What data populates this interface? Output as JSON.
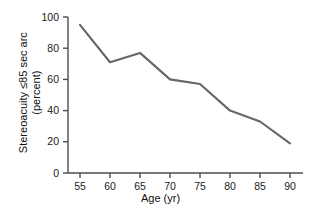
{
  "chart_data": {
    "type": "line",
    "title": "",
    "subtitle": "",
    "xlabel": "Age (yr)",
    "ylabel": "Stereoacuity ≤85 sec arc (percent)",
    "ylabel_line1": "Stereoacuity ≤85 sec arc",
    "ylabel_line2": "(percent)",
    "x": [
      55,
      60,
      65,
      70,
      75,
      80,
      85,
      90
    ],
    "values": [
      95,
      71,
      77,
      60,
      57,
      40,
      33,
      19
    ],
    "series": [
      {
        "name": "Stereoacuity ≤85 sec arc",
        "values": [
          95,
          71,
          77,
          60,
          57,
          40,
          33,
          19
        ]
      }
    ],
    "xtick_labels": [
      "55",
      "60",
      "65",
      "70",
      "75",
      "80",
      "85",
      "90"
    ],
    "ytick_labels": [
      "0",
      "20",
      "40",
      "60",
      "80",
      "100"
    ],
    "ytick_values": [
      0,
      20,
      40,
      60,
      80,
      100
    ],
    "xlim": [
      52.5,
      92.5
    ],
    "ylim": [
      0,
      100
    ],
    "grid": false,
    "legend": "none",
    "line_color": "#666666",
    "axis_color": "#4d4d4d",
    "text_color": "#111111",
    "background": "#ffffff"
  },
  "axes": {
    "x_ticks": [
      {
        "label": "55"
      },
      {
        "label": "60"
      },
      {
        "label": "65"
      },
      {
        "label": "70"
      },
      {
        "label": "75"
      },
      {
        "label": "80"
      },
      {
        "label": "85"
      },
      {
        "label": "90"
      }
    ],
    "y_ticks": [
      {
        "label": "100"
      },
      {
        "label": "80"
      },
      {
        "label": "60"
      },
      {
        "label": "40"
      },
      {
        "label": "20"
      },
      {
        "label": "0"
      }
    ],
    "x_title": "Age (yr)",
    "y_title_line1": "Stereoacuity ≤85 sec arc",
    "y_title_line2": "(percent)"
  }
}
